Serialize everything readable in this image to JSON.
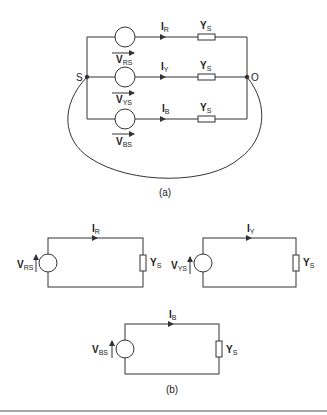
{
  "figure_a": {
    "caption": "(a)",
    "node_left": "S",
    "node_right": "O",
    "branches": [
      {
        "source": "V",
        "source_sub": "RS",
        "current": "I",
        "current_sub": "R",
        "admittance": "Y",
        "admittance_sub": "S"
      },
      {
        "source": "V",
        "source_sub": "YS",
        "current": "I",
        "current_sub": "Y",
        "admittance": "Y",
        "admittance_sub": "S"
      },
      {
        "source": "V",
        "source_sub": "BS",
        "current": "I",
        "current_sub": "B",
        "admittance": "Y",
        "admittance_sub": "S"
      }
    ]
  },
  "figure_b": {
    "caption": "(b)",
    "circuits": [
      {
        "source": "V",
        "source_sub": "RS",
        "current": "I",
        "current_sub": "R",
        "admittance": "Y",
        "admittance_sub": "S"
      },
      {
        "source": "V",
        "source_sub": "YS",
        "current": "I",
        "current_sub": "Y",
        "admittance": "Y",
        "admittance_sub": "S"
      },
      {
        "source": "V",
        "source_sub": "BS",
        "current": "I",
        "current_sub": "B",
        "admittance": "Y",
        "admittance_sub": "S"
      }
    ]
  },
  "colors": {
    "line": "#333333",
    "background": "#ffffff",
    "rule": "#888888"
  }
}
